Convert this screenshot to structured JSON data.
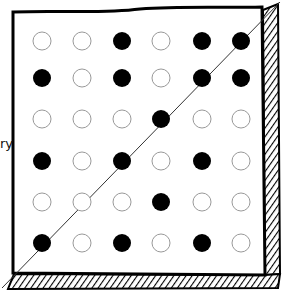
{
  "diagram": {
    "edge_label": "ry",
    "grid": [
      [
        "open",
        "open",
        "filled",
        "open",
        "filled",
        "filled"
      ],
      [
        "filled",
        "open",
        "filled",
        "open",
        "filled",
        "filled"
      ],
      [
        "open",
        "open",
        "open",
        "filled",
        "open",
        "open"
      ],
      [
        "filled",
        "open",
        "filled",
        "open",
        "filled",
        "open"
      ],
      [
        "open",
        "open",
        "open",
        "filled",
        "open",
        "open"
      ],
      [
        "filled",
        "open",
        "filled",
        "open",
        "filled",
        "open"
      ]
    ],
    "colors": {
      "filled": "#000000",
      "open_stroke": "#999999",
      "border": "#000000"
    }
  }
}
